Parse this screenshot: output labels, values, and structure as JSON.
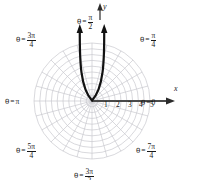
{
  "figure": {
    "kind": "polar-grid-plot",
    "background": "#ffffff",
    "grid_color": "#c9c9cf",
    "curve_color": "#111111",
    "axis_color": "#4a4a4a",
    "text_color": "#1a1a1a"
  },
  "axes": {
    "x_label": "x",
    "y_label": "y",
    "radial_ticks": [
      "1",
      "2",
      "3",
      "4",
      "5"
    ],
    "origin_px": [
      92,
      101
    ],
    "unit_px": 11.6
  },
  "angle_labels": [
    {
      "id": "pi-2",
      "theta": "θ",
      "eq": "=",
      "num": "π",
      "den": "2",
      "plain": "θ = π/2"
    },
    {
      "id": "3pi-4",
      "theta": "θ",
      "eq": "=",
      "num": "3π",
      "den": "4",
      "plain": "θ = 3π/4"
    },
    {
      "id": "pi-4",
      "theta": "θ",
      "eq": "=",
      "num": "π",
      "den": "4",
      "plain": "θ = π/4"
    },
    {
      "id": "pi",
      "theta": "θ",
      "eq": "=",
      "num": "π",
      "den": "",
      "plain": "θ = π"
    },
    {
      "id": "zero",
      "theta": "θ",
      "eq": "=",
      "num": "0",
      "den": "",
      "plain": "θ = 0"
    },
    {
      "id": "5pi-4",
      "theta": "θ",
      "eq": "=",
      "num": "5π",
      "den": "4",
      "plain": "θ = 5π/4"
    },
    {
      "id": "7pi-4",
      "theta": "θ",
      "eq": "=",
      "num": "7π",
      "den": "4",
      "plain": "θ = 7π/4"
    },
    {
      "id": "3pi-2",
      "theta": "θ",
      "eq": "=",
      "num": "3π",
      "den": "2",
      "plain": "θ = 3π/2"
    }
  ],
  "chart_data": {
    "type": "line",
    "title": "",
    "xlabel": "x",
    "ylabel": "y",
    "coordinate_system": "polar",
    "grid": true,
    "legend": null,
    "radial_axis": {
      "ticks": [
        1,
        2,
        3,
        4,
        5
      ],
      "rmax": 5,
      "circles": 5,
      "subcircles_per_unit": 1
    },
    "angular_axis": {
      "spoke_spacing_deg": 15,
      "labeled_angles_rad": [
        "0",
        "pi/4",
        "pi/2",
        "3pi/4",
        "pi",
        "5pi/4",
        "3pi/2",
        "7pi/4"
      ],
      "labeled_angles_deg": [
        0,
        45,
        90,
        135,
        180,
        225,
        270,
        315
      ]
    },
    "series": [
      {
        "name": "curve",
        "description": "narrow upward-opening U curve with vertex at the pole, arrowheads on both ends pointing up",
        "arrow_start": true,
        "arrow_end": true,
        "x": [
          -1.05,
          -1.04,
          -1.02,
          -0.99,
          -0.94,
          -0.87,
          -0.77,
          -0.62,
          -0.4,
          -0.18,
          0.0,
          0.18,
          0.4,
          0.62,
          0.77,
          0.87,
          0.94,
          0.99,
          1.02,
          1.04,
          1.05
        ],
        "y": [
          6.3,
          5.6,
          4.9,
          4.2,
          3.5,
          2.8,
          2.1,
          1.4,
          0.62,
          0.14,
          0.0,
          0.14,
          0.62,
          1.4,
          2.1,
          2.8,
          3.5,
          4.2,
          4.9,
          5.6,
          6.3
        ]
      },
      {
        "name": "polar-axis-ray",
        "description": "bold horizontal ray along theta = 0 from pole to r = 5 with arrowhead",
        "x": [
          0,
          5
        ],
        "y": [
          0,
          0
        ],
        "arrow_end": true
      },
      {
        "name": "y-axis-ray",
        "description": "short vertical arrow at theta = pi/2 labelled y",
        "x": [
          0,
          0
        ],
        "y": [
          0,
          6.9
        ],
        "arrow_end": true
      }
    ]
  }
}
